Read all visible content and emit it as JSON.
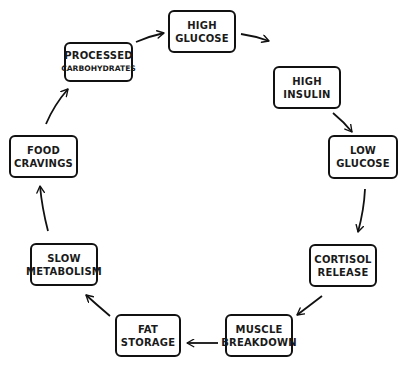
{
  "diagram": {
    "type": "cycle",
    "stroke_color": "#111111",
    "background": "#ffffff",
    "nodes": [
      {
        "id": "high-glucose",
        "lines": [
          "HIGH",
          "GLUCOSE"
        ]
      },
      {
        "id": "high-insulin",
        "lines": [
          "HIGH",
          "INSULIN"
        ]
      },
      {
        "id": "low-glucose",
        "lines": [
          "LOW",
          "GLUCOSE"
        ]
      },
      {
        "id": "cortisol-release",
        "lines": [
          "CORTISOL",
          "RELEASE"
        ]
      },
      {
        "id": "muscle-breakdown",
        "lines": [
          "MUSCLE",
          "BREAKDOWN"
        ]
      },
      {
        "id": "fat-storage",
        "lines": [
          "FAT",
          "STORAGE"
        ]
      },
      {
        "id": "slow-metabolism",
        "lines": [
          "SLOW",
          "METABOLISM"
        ]
      },
      {
        "id": "food-cravings",
        "lines": [
          "FOOD",
          "CRAVINGS"
        ]
      },
      {
        "id": "processed-carbohydrates",
        "lines": [
          "PROCESSED",
          "CARBOHYDRATES"
        ]
      }
    ],
    "edges": [
      {
        "from": "high-glucose",
        "to": "high-insulin"
      },
      {
        "from": "high-insulin",
        "to": "low-glucose"
      },
      {
        "from": "low-glucose",
        "to": "cortisol-release"
      },
      {
        "from": "cortisol-release",
        "to": "muscle-breakdown"
      },
      {
        "from": "muscle-breakdown",
        "to": "fat-storage"
      },
      {
        "from": "fat-storage",
        "to": "slow-metabolism"
      },
      {
        "from": "slow-metabolism",
        "to": "food-cravings"
      },
      {
        "from": "food-cravings",
        "to": "processed-carbohydrates"
      },
      {
        "from": "processed-carbohydrates",
        "to": "high-glucose"
      }
    ]
  }
}
